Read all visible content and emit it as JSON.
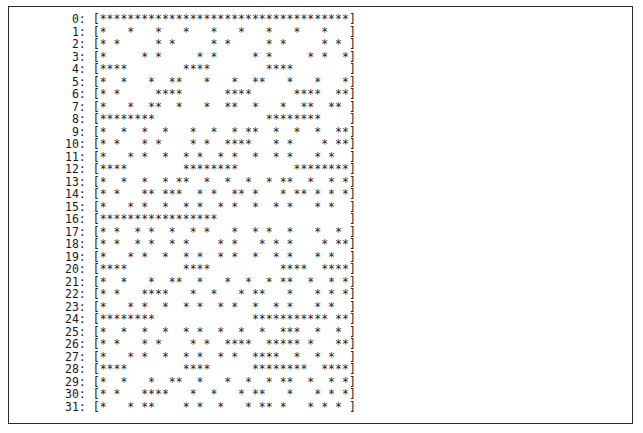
{
  "window": {
    "background_color": "#ffffff",
    "border_color": "#2b2b2b",
    "text_color": "#1a1a1a"
  },
  "output": {
    "row_count": 32,
    "column_count": 36,
    "open_bracket": "[",
    "close_bracket": "]",
    "separator": ": ",
    "filled_char": "*",
    "empty_char": " ",
    "rows": [
      {
        "index": "0",
        "label": " 0",
        "cells": "************************************"
      },
      {
        "index": "1",
        "label": " 1",
        "cells": "*   *   *   *   *   *   *   *   *   "
      },
      {
        "index": "2",
        "label": " 2",
        "cells": "* *     * *     * *     * *     * * "
      },
      {
        "index": "3",
        "label": " 3",
        "cells": "*     * *     * *     * *     * *  *"
      },
      {
        "index": "4",
        "label": " 4",
        "cells": "****        ****        ****        "
      },
      {
        "index": "5",
        "label": " 5",
        "cells": "*  *   *  **   *   *  **   *   *   *"
      },
      {
        "index": "6",
        "label": " 6",
        "cells": "* *     ****      ****      ****  **"
      },
      {
        "index": "7",
        "label": " 7",
        "cells": "*   *  **  *   *  **  *   *  **  ** "
      },
      {
        "index": "8",
        "label": " 8",
        "cells": "********                ********     "
      },
      {
        "index": "9",
        "label": " 9",
        "cells": "*  *  *  *   *  *  * **  *  *  *  **"
      },
      {
        "index": "10",
        "label": "10",
        "cells": "* *   * *    * *  ****   * *    * **"
      },
      {
        "index": "11",
        "label": "11",
        "cells": "*   * *  *  * *  * *  *  * *   * *  "
      },
      {
        "index": "12",
        "label": "12",
        "cells": "****        ********        ********"
      },
      {
        "index": "13",
        "label": "13",
        "cells": "*  *  *  * **  *  *  *  * **  *  * *"
      },
      {
        "index": "14",
        "label": "14",
        "cells": "* *   ** ***  * *  ** *   * ** * * *"
      },
      {
        "index": "15",
        "label": "15",
        "cells": "*   * *  *  * *  * *  *  * *   * *  "
      },
      {
        "index": "16",
        "label": "16",
        "cells": "*****************                   "
      },
      {
        "index": "17",
        "label": "17",
        "cells": "* *  * *  *  * *   *  * *  *   *  * "
      },
      {
        "index": "18",
        "label": "18",
        "cells": "* *  * *  * *    * *   * * *    * **"
      },
      {
        "index": "19",
        "label": "19",
        "cells": "*   * *  *  * *  * *  *  * *   * *  "
      },
      {
        "index": "20",
        "label": "20",
        "cells": "****        ****          ****  ****"
      },
      {
        "index": "21",
        "label": "21",
        "cells": "*  *   *  **  *   *  *  * **  *  * *"
      },
      {
        "index": "22",
        "label": "22",
        "cells": "* *   ****   *  *   * **   *   * * *"
      },
      {
        "index": "23",
        "label": "23",
        "cells": "*   * *  *  * *  * *  *  * *   * *  "
      },
      {
        "index": "24",
        "label": "24",
        "cells": "********              *********** **"
      },
      {
        "index": "25",
        "label": "25",
        "cells": "*  *  *  *  * *  *  *  *  ***  *  * "
      },
      {
        "index": "26",
        "label": "26",
        "cells": "* *   * *    * *  ****  ***** *   **"
      },
      {
        "index": "27",
        "label": "27",
        "cells": "*   * *  *  * *  * *  ****  *  * *  "
      },
      {
        "index": "28",
        "label": "28",
        "cells": "****        ****      ********  ****"
      },
      {
        "index": "29",
        "label": "29",
        "cells": "*  *   *  **  *   *  *  * **  *  * *"
      },
      {
        "index": "30",
        "label": "30",
        "cells": "* *   ****   *  *   * **   *   * * *"
      },
      {
        "index": "31",
        "label": "31",
        "cells": "*   * **    * *  *   * ** *   * * * "
      }
    ]
  }
}
